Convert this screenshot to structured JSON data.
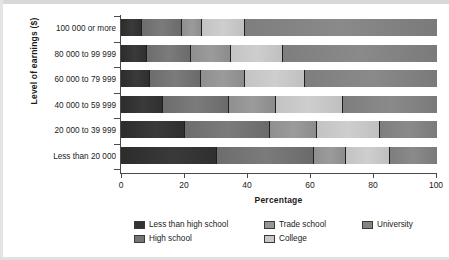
{
  "chart_data": {
    "type": "bar",
    "orientation": "horizontal",
    "stacked": true,
    "stack_mode": "percent",
    "title": "",
    "xlabel": "Percentage",
    "ylabel": "Level of earnings ($)",
    "xlim": [
      0,
      100
    ],
    "xticks": [
      0,
      20,
      40,
      60,
      80,
      100
    ],
    "xtick_labels": [
      "0",
      "20",
      "40",
      "60",
      "80",
      "100"
    ],
    "grid": false,
    "legend_position": "bottom",
    "categories": [
      "100 000 or more",
      "80 000 to 99 999",
      "60 000 to 79 999",
      "40 000 to 59 999",
      "20 000 to 39 999",
      "Less than 20 000"
    ],
    "series": [
      {
        "name": "Less than high school",
        "color": "#333333",
        "values": [
          6.5,
          8,
          9,
          13,
          20,
          30
        ]
      },
      {
        "name": "High school",
        "color": "#757575",
        "values": [
          12.5,
          14,
          16,
          21,
          27,
          31
        ]
      },
      {
        "name": "Trade school",
        "color": "#969696",
        "values": [
          6.5,
          12.5,
          14,
          15,
          15,
          10
        ]
      },
      {
        "name": "College",
        "color": "#c8c8c8",
        "values": [
          13.5,
          16.5,
          19,
          21,
          20,
          14
        ]
      },
      {
        "name": "University",
        "color": "#848484",
        "values": [
          61,
          49,
          42,
          30,
          18,
          15
        ]
      }
    ]
  },
  "legend": {
    "items": [
      {
        "label": "Less than high school",
        "swatch": "#333333"
      },
      {
        "label": "High school",
        "swatch": "#757575"
      },
      {
        "label": "Trade school",
        "swatch": "#969696"
      },
      {
        "label": "College",
        "swatch": "#c8c8c8"
      },
      {
        "label": "University",
        "swatch": "#848484"
      }
    ]
  }
}
